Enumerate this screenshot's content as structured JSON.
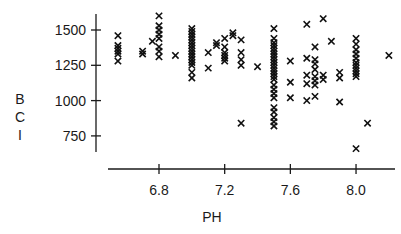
{
  "chart_data": {
    "type": "scatter",
    "title": "",
    "xlabel": "PH",
    "ylabel": "BCI",
    "xlim": [
      6.49,
      8.25
    ],
    "ylim": [
      680,
      1615
    ],
    "xticks": [
      6.8,
      7.2,
      7.6,
      8.0
    ],
    "xtick_labels": [
      "6.8",
      "7.2",
      "7.6",
      "8.0"
    ],
    "yticks": [
      750,
      1000,
      1250,
      1500
    ],
    "ytick_labels": [
      "750",
      "1000",
      "1250",
      "1500"
    ],
    "grid": false,
    "legend": null,
    "marker": "x",
    "series": [
      {
        "name": "BCI vs PH",
        "points": [
          [
            6.55,
            1460
          ],
          [
            6.55,
            1390
          ],
          [
            6.55,
            1370
          ],
          [
            6.55,
            1350
          ],
          [
            6.55,
            1330
          ],
          [
            6.55,
            1280
          ],
          [
            6.7,
            1350
          ],
          [
            6.7,
            1330
          ],
          [
            6.76,
            1420
          ],
          [
            6.8,
            1600
          ],
          [
            6.8,
            1530
          ],
          [
            6.8,
            1500
          ],
          [
            6.8,
            1470
          ],
          [
            6.8,
            1440
          ],
          [
            6.8,
            1380
          ],
          [
            6.8,
            1350
          ],
          [
            6.8,
            1310
          ],
          [
            6.9,
            1320
          ],
          [
            7.0,
            1510
          ],
          [
            7.0,
            1490
          ],
          [
            7.0,
            1470
          ],
          [
            7.0,
            1450
          ],
          [
            7.0,
            1430
          ],
          [
            7.0,
            1410
          ],
          [
            7.0,
            1390
          ],
          [
            7.0,
            1370
          ],
          [
            7.0,
            1350
          ],
          [
            7.0,
            1330
          ],
          [
            7.0,
            1310
          ],
          [
            7.0,
            1290
          ],
          [
            7.0,
            1270
          ],
          [
            7.0,
            1250
          ],
          [
            7.0,
            1200
          ],
          [
            7.0,
            1160
          ],
          [
            7.1,
            1340
          ],
          [
            7.1,
            1230
          ],
          [
            7.15,
            1410
          ],
          [
            7.15,
            1390
          ],
          [
            7.2,
            1440
          ],
          [
            7.2,
            1380
          ],
          [
            7.2,
            1340
          ],
          [
            7.2,
            1320
          ],
          [
            7.2,
            1300
          ],
          [
            7.2,
            1280
          ],
          [
            7.25,
            1480
          ],
          [
            7.25,
            1460
          ],
          [
            7.3,
            1430
          ],
          [
            7.3,
            1340
          ],
          [
            7.3,
            1290
          ],
          [
            7.3,
            1250
          ],
          [
            7.3,
            840
          ],
          [
            7.4,
            1240
          ],
          [
            7.5,
            1510
          ],
          [
            7.5,
            1440
          ],
          [
            7.5,
            1410
          ],
          [
            7.5,
            1390
          ],
          [
            7.5,
            1370
          ],
          [
            7.5,
            1350
          ],
          [
            7.5,
            1330
          ],
          [
            7.5,
            1310
          ],
          [
            7.5,
            1290
          ],
          [
            7.5,
            1270
          ],
          [
            7.5,
            1250
          ],
          [
            7.5,
            1230
          ],
          [
            7.5,
            1210
          ],
          [
            7.5,
            1190
          ],
          [
            7.5,
            1170
          ],
          [
            7.5,
            1150
          ],
          [
            7.5,
            1110
          ],
          [
            7.5,
            1080
          ],
          [
            7.5,
            1050
          ],
          [
            7.5,
            1020
          ],
          [
            7.5,
            950
          ],
          [
            7.5,
            920
          ],
          [
            7.5,
            880
          ],
          [
            7.5,
            850
          ],
          [
            7.5,
            820
          ],
          [
            7.6,
            1280
          ],
          [
            7.6,
            1130
          ],
          [
            7.6,
            1020
          ],
          [
            7.7,
            1540
          ],
          [
            7.7,
            1300
          ],
          [
            7.7,
            1180
          ],
          [
            7.7,
            1120
          ],
          [
            7.7,
            1000
          ],
          [
            7.75,
            1380
          ],
          [
            7.75,
            1290
          ],
          [
            7.75,
            1260
          ],
          [
            7.75,
            1220
          ],
          [
            7.75,
            1170
          ],
          [
            7.75,
            1140
          ],
          [
            7.75,
            1110
          ],
          [
            7.75,
            1030
          ],
          [
            7.8,
            1580
          ],
          [
            7.8,
            1180
          ],
          [
            7.8,
            1150
          ],
          [
            7.85,
            1420
          ],
          [
            7.9,
            1200
          ],
          [
            7.9,
            1160
          ],
          [
            7.9,
            990
          ],
          [
            8.0,
            1440
          ],
          [
            8.0,
            1400
          ],
          [
            8.0,
            1360
          ],
          [
            8.0,
            1330
          ],
          [
            8.0,
            1300
          ],
          [
            8.0,
            1270
          ],
          [
            8.0,
            1250
          ],
          [
            8.0,
            1230
          ],
          [
            8.0,
            1210
          ],
          [
            8.0,
            1190
          ],
          [
            8.0,
            1170
          ],
          [
            8.0,
            660
          ],
          [
            8.07,
            840
          ],
          [
            8.2,
            1320
          ]
        ]
      }
    ]
  }
}
